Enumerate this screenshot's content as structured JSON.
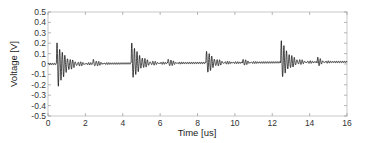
{
  "chart_data": {
    "type": "line",
    "title": "",
    "xlabel": "Time [us]",
    "ylabel": "Voltage [V]",
    "xlim": [
      0,
      16
    ],
    "ylim": [
      -0.5,
      0.5
    ],
    "xticks": [
      0,
      2,
      4,
      6,
      8,
      10,
      12,
      14,
      16
    ],
    "yticks": [
      0.5,
      0.4,
      0.3,
      0.2,
      0.1,
      0,
      -0.1,
      -0.2,
      -0.3,
      -0.4,
      -0.5
    ],
    "xtick_labels": [
      "0",
      "2",
      "4",
      "6",
      "8",
      "10",
      "12",
      "14",
      "16"
    ],
    "ytick_labels": [
      "0.5",
      "0.4",
      "0.3",
      "0.2",
      "0.1",
      "0",
      "-0.1",
      "-0.2",
      "-0.3",
      "-0.4",
      "-0.5"
    ],
    "grid": false,
    "legend": null,
    "series": [
      {
        "name": "Voltage",
        "color": "#000000",
        "description": "Baseline near 0 V with slight upward drift (to ~0.02 V); damped oscillation bursts repeating every ~4 us with smaller echoes ~2 us later",
        "baseline_start": 0.0,
        "baseline_end": 0.02,
        "bursts": [
          {
            "t0": 0.45,
            "peak": 0.22,
            "trough": -0.28,
            "decay_us": 1.4
          },
          {
            "t0": 2.4,
            "peak": 0.05,
            "trough": -0.04,
            "decay_us": 0.8
          },
          {
            "t0": 4.45,
            "peak": 0.22,
            "trough": -0.18,
            "decay_us": 1.4
          },
          {
            "t0": 6.4,
            "peak": 0.05,
            "trough": -0.04,
            "decay_us": 0.8
          },
          {
            "t0": 8.45,
            "peak": 0.13,
            "trough": -0.12,
            "decay_us": 1.3
          },
          {
            "t0": 10.4,
            "peak": 0.04,
            "trough": -0.03,
            "decay_us": 0.8
          },
          {
            "t0": 12.45,
            "peak": 0.23,
            "trough": -0.17,
            "decay_us": 1.4
          },
          {
            "t0": 14.4,
            "peak": 0.05,
            "trough": -0.04,
            "decay_us": 0.8
          }
        ],
        "oscillation_period_us": 0.14
      }
    ]
  }
}
